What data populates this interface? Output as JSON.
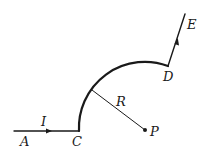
{
  "diagram": {
    "labels": {
      "A": "A",
      "C": "C",
      "D": "D",
      "E": "E",
      "P": "P",
      "R": "R",
      "I": "I"
    },
    "colors": {
      "line": "#1a1a1a",
      "background": "#ffffff"
    }
  }
}
